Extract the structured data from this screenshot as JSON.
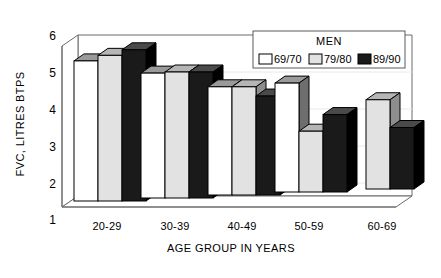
{
  "chart_data": {
    "type": "bar",
    "title": "",
    "xlabel": "AGE GROUP IN YEARS",
    "ylabel": "FVC, LITRES BTPS",
    "ylim": [
      1,
      6
    ],
    "yticks": [
      "1",
      "2",
      "3",
      "4",
      "5",
      "6"
    ],
    "grid": false,
    "legend_position": "top-right",
    "legend_title": "MEN",
    "categories": [
      "20-29",
      "30-39",
      "40-49",
      "50-59",
      "60-69"
    ],
    "series": [
      {
        "name": "69/70",
        "color": "#ffffff",
        "values": [
          5.3,
          4.97,
          4.6,
          4.7,
          null
        ]
      },
      {
        "name": "79/80",
        "color": "#e2e2e2",
        "values": [
          5.45,
          5.0,
          4.6,
          3.4,
          4.25
        ]
      },
      {
        "name": "89/90",
        "color": "#1a1a1a",
        "values": [
          5.6,
          5.0,
          4.35,
          3.85,
          3.5
        ]
      }
    ]
  },
  "axes": {
    "y_title": "FVC, LITRES BTPS",
    "x_title": "AGE GROUP IN YEARS"
  },
  "legend": {
    "title": "MEN",
    "items": [
      {
        "label": "69/70",
        "swatch": "#ffffff"
      },
      {
        "label": "79/80",
        "swatch": "#e2e2e2"
      },
      {
        "label": "89/90",
        "swatch": "#1a1a1a"
      }
    ]
  },
  "colors": {
    "line": "#000000",
    "frame": "#5a5a5a",
    "bar_white": "#ffffff",
    "bar_gray": "#e2e2e2",
    "bar_black": "#1a1a1a"
  }
}
